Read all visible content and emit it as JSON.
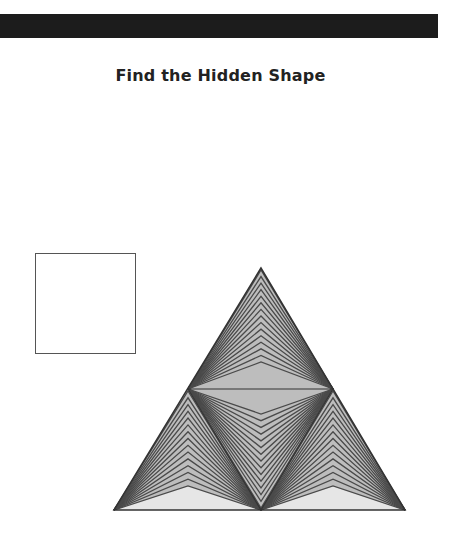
{
  "header": {
    "bar_color": "#1c1c1c"
  },
  "title": "Find the Hidden Shape",
  "target_shape": {
    "name": "square",
    "border_color": "#555555"
  },
  "puzzle": {
    "shape": "triangle-of-triangles",
    "outline_color": "#333333",
    "line_color": "#4a4a4a",
    "fill_gray": "#bdbdbd",
    "fill_light": "#e6e6e6",
    "chevrons_per_section": 15,
    "points": {
      "apex": [
        261,
        268
      ],
      "bottom_left": [
        114,
        510
      ],
      "bottom_right": [
        405,
        510
      ],
      "mid_left": [
        188,
        389
      ],
      "mid_right": [
        333,
        389
      ],
      "mid_bottom": [
        261,
        510
      ]
    }
  }
}
